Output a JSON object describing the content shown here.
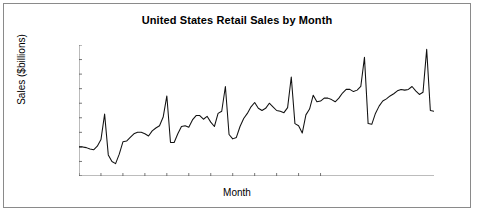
{
  "chart_data": {
    "type": "line",
    "title": "United States Retail Sales by Month",
    "xlabel": "Month",
    "ylabel": "Sales ($billions)",
    "ylim": [
      70,
      160
    ],
    "ytick_step": 10,
    "yticks": [
      70,
      80,
      90,
      100,
      110,
      120,
      130,
      140,
      150,
      160
    ],
    "xticks": [
      "Jun-82",
      "Dec-82",
      "Jun-83",
      "Dec-83",
      "Jun-84",
      "Dec-84",
      "Jun-85",
      "Dec-85",
      "Jun-86",
      "Dec-86",
      "Jun-87",
      "Dec-87"
    ],
    "grid": false,
    "legend": "none",
    "line_color": "#111111",
    "series": [
      {
        "name": "Retail Sales",
        "x": [
          "Jun-82",
          "Jul-82",
          "Aug-82",
          "Sep-82",
          "Oct-82",
          "Nov-82",
          "Dec-82",
          "Jan-83",
          "Feb-83",
          "Mar-83",
          "Apr-83",
          "May-83",
          "Jun-83",
          "Jul-83",
          "Aug-83",
          "Sep-83",
          "Oct-83",
          "Nov-83",
          "Dec-83",
          "Jan-84",
          "Feb-84",
          "Mar-84",
          "Apr-84",
          "May-84",
          "Jun-84",
          "Jul-84",
          "Aug-84",
          "Sep-84",
          "Oct-84",
          "Nov-84",
          "Dec-84",
          "Jan-85",
          "Feb-85",
          "Mar-85",
          "Apr-85",
          "May-85",
          "Jun-85",
          "Jul-85",
          "Aug-85",
          "Sep-85",
          "Oct-85",
          "Nov-85",
          "Dec-85",
          "Jan-86",
          "Feb-86",
          "Mar-86",
          "Apr-86",
          "May-86",
          "Jun-86",
          "Jul-86",
          "Aug-86",
          "Sep-86",
          "Oct-86",
          "Nov-86",
          "Dec-86",
          "Jan-87",
          "Feb-87",
          "Mar-87",
          "Apr-87",
          "May-87",
          "Jun-87",
          "Jul-87",
          "Aug-87",
          "Sep-87",
          "Oct-87",
          "Nov-87",
          "Dec-87",
          "Jan-88",
          "Feb-88",
          "Mar-88"
        ],
        "values": [
          90.0,
          90.0,
          89.5,
          88.5,
          88.0,
          90.5,
          95.0,
          112.5,
          84.5,
          80.0,
          78.5,
          85.0,
          93.5,
          94.0,
          96.5,
          99.0,
          100.0,
          100.0,
          99.0,
          97.5,
          101.0,
          103.0,
          104.5,
          110.5,
          125.0,
          93.0,
          93.0,
          99.0,
          104.0,
          104.5,
          103.5,
          108.5,
          111.5,
          111.5,
          109.0,
          111.0,
          107.0,
          104.0,
          113.0,
          114.5,
          131.5,
          98.5,
          95.5,
          96.5,
          104.0,
          109.5,
          113.0,
          117.5,
          120.5,
          116.5,
          115.0,
          116.5,
          120.0,
          117.5,
          115.0,
          114.5,
          113.5,
          117.0,
          138.0,
          106.0,
          104.5,
          99.5,
          112.0,
          116.0,
          125.5,
          121.0,
          121.5,
          123.5,
          123.5,
          122.5
        ]
      }
    ],
    "note_series2": {
      "name": "Retail Sales (continued)",
      "values_tail": [
        121.0,
        123.5,
        127.0,
        129.5,
        129.5,
        128.0,
        129.0,
        131.5,
        128.5,
        126.0,
        127.5,
        157.0,
        115.0,
        114.5
      ]
    },
    "peaks": [
      {
        "label": "Dec-82",
        "value": 112.5
      },
      {
        "label": "Dec-83",
        "value": 125.0
      },
      {
        "label": "Dec-84",
        "value": 131.5
      },
      {
        "label": "Dec-85",
        "value": 138.0
      },
      {
        "label": "Dec-86",
        "value": 151.5
      },
      {
        "label": "Dec-87",
        "value": 157.0
      }
    ],
    "troughs": [
      {
        "label": "Feb-83",
        "value": 78.5
      },
      {
        "label": "Feb-84",
        "value": 93.0
      },
      {
        "label": "Feb-85",
        "value": 95.5
      },
      {
        "label": "Feb-86",
        "value": 99.5
      },
      {
        "label": "Jan-87",
        "value": 106.0
      },
      {
        "label": "Feb-88",
        "value": 114.5
      }
    ],
    "plot_points_y": [
      90.0,
      90.0,
      89.5,
      88.5,
      88.0,
      90.5,
      95.0,
      112.5,
      84.5,
      80.0,
      78.5,
      85.0,
      93.5,
      94.0,
      96.5,
      99.0,
      100.0,
      100.0,
      99.0,
      97.5,
      101.0,
      103.0,
      104.5,
      110.5,
      125.0,
      93.0,
      93.0,
      99.0,
      104.0,
      104.5,
      103.5,
      108.5,
      111.5,
      111.5,
      109.0,
      111.0,
      107.0,
      104.0,
      113.0,
      114.5,
      131.5,
      98.5,
      95.5,
      96.5,
      104.0,
      109.5,
      113.0,
      117.5,
      120.5,
      116.5,
      115.0,
      116.5,
      120.0,
      117.5,
      115.0,
      114.5,
      113.5,
      117.0,
      138.0,
      106.0,
      104.5,
      99.5,
      112.0,
      116.0,
      125.5,
      121.0,
      121.5,
      123.5,
      123.5,
      122.5,
      121.0,
      123.5,
      127.0,
      129.5,
      129.5,
      128.0,
      129.0,
      131.5,
      151.5,
      106.0,
      105.5,
      113.0,
      118.0,
      121.5,
      123.0,
      125.0,
      126.5,
      128.5,
      129.5,
      129.0,
      129.5,
      131.5,
      128.5,
      126.0,
      127.5,
      157.0,
      115.0,
      114.5
    ]
  }
}
